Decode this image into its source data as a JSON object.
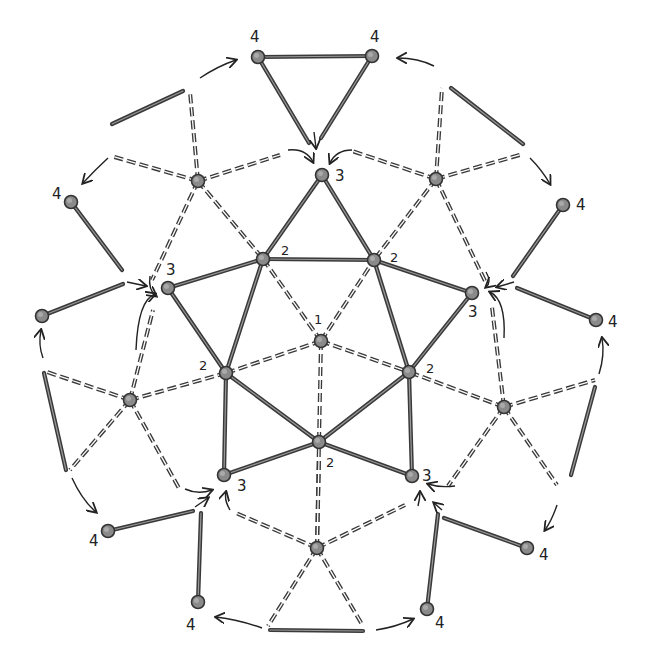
{
  "diagram": {
    "colors": {
      "edge": "#3a3a3a",
      "node_fill": "#8a8a8a",
      "background": "#ffffff"
    },
    "nodes": [
      {
        "id": "c",
        "x": 321,
        "y": 341,
        "label": "1",
        "lx": 314,
        "ly": 324
      },
      {
        "id": "a2",
        "x": 263,
        "y": 259,
        "label": "2",
        "lx": 281,
        "ly": 255
      },
      {
        "id": "b2",
        "x": 374,
        "y": 260,
        "label": "2",
        "lx": 390,
        "ly": 262
      },
      {
        "id": "d2",
        "x": 226,
        "y": 373,
        "label": "2",
        "lx": 199,
        "ly": 370
      },
      {
        "id": "e2",
        "x": 409,
        "y": 372,
        "label": "2",
        "lx": 426,
        "ly": 373
      },
      {
        "id": "f2",
        "x": 319,
        "y": 442,
        "label": "2",
        "lx": 326,
        "ly": 467
      },
      {
        "id": "a3",
        "x": 322,
        "y": 175,
        "label": "3",
        "lx": 335,
        "ly": 181
      },
      {
        "id": "b3",
        "x": 168,
        "y": 288,
        "label": "3",
        "lx": 166,
        "ly": 275
      },
      {
        "id": "c3",
        "x": 472,
        "y": 293,
        "label": "3",
        "lx": 468,
        "ly": 317
      },
      {
        "id": "d3",
        "x": 224,
        "y": 475,
        "label": "3",
        "lx": 237,
        "ly": 491
      },
      {
        "id": "e3",
        "x": 412,
        "y": 476,
        "label": "3",
        "lx": 422,
        "ly": 481
      },
      {
        "id": "h1",
        "x": 198,
        "y": 181,
        "label": "",
        "lx": 0,
        "ly": 0
      },
      {
        "id": "h2",
        "x": 436,
        "y": 179,
        "label": "",
        "lx": 0,
        "ly": 0
      },
      {
        "id": "h3",
        "x": 130,
        "y": 400,
        "label": "",
        "lx": 0,
        "ly": 0
      },
      {
        "id": "h4",
        "x": 504,
        "y": 407,
        "label": "",
        "lx": 0,
        "ly": 0
      },
      {
        "id": "h5",
        "x": 317,
        "y": 548,
        "label": "",
        "lx": 0,
        "ly": 0
      },
      {
        "id": "t1",
        "x": 258,
        "y": 57,
        "label": "4",
        "lx": 250,
        "ly": 42
      },
      {
        "id": "t2",
        "x": 372,
        "y": 56,
        "label": "4",
        "lx": 370,
        "ly": 42
      },
      {
        "id": "l1",
        "x": 71,
        "y": 202,
        "label": "4",
        "lx": 52,
        "ly": 199
      },
      {
        "id": "l2",
        "x": 42,
        "y": 316,
        "label": "",
        "lx": 0,
        "ly": 0
      },
      {
        "id": "r1",
        "x": 563,
        "y": 205,
        "label": "4",
        "lx": 576,
        "ly": 210
      },
      {
        "id": "r2",
        "x": 596,
        "y": 320,
        "label": "4",
        "lx": 608,
        "ly": 327
      },
      {
        "id": "bl1",
        "x": 108,
        "y": 531,
        "label": "4",
        "lx": 89,
        "ly": 546
      },
      {
        "id": "bl2",
        "x": 198,
        "y": 602,
        "label": "4",
        "lx": 186,
        "ly": 630
      },
      {
        "id": "br1",
        "x": 527,
        "y": 548,
        "label": "4",
        "lx": 539,
        "ly": 560
      },
      {
        "id": "br2",
        "x": 427,
        "y": 609,
        "label": "4",
        "lx": 435,
        "ly": 628
      }
    ],
    "solid_edges": [
      [
        "a2",
        "b2"
      ],
      [
        "a2",
        "a3"
      ],
      [
        "b2",
        "a3"
      ],
      [
        "a2",
        "b3"
      ],
      [
        "a2",
        "d2"
      ],
      [
        "b3",
        "d2"
      ],
      [
        "b2",
        "c3"
      ],
      [
        "b2",
        "e2"
      ],
      [
        "c3",
        "e2"
      ],
      [
        "d2",
        "f2"
      ],
      [
        "d2",
        "d3"
      ],
      [
        "d3",
        "f2"
      ],
      [
        "e2",
        "f2"
      ],
      [
        "e2",
        "e3"
      ],
      [
        "e3",
        "f2"
      ],
      [
        "t1",
        "t2"
      ]
    ],
    "solid_segments": [
      [
        258,
        57,
        309,
        143
      ],
      [
        372,
        56,
        321,
        138
      ],
      [
        71,
        202,
        122,
        270
      ],
      [
        42,
        316,
        123,
        284
      ],
      [
        563,
        205,
        513,
        276
      ],
      [
        596,
        320,
        517,
        288
      ],
      [
        108,
        531,
        193,
        511
      ],
      [
        198,
        602,
        201,
        513
      ],
      [
        527,
        548,
        444,
        518
      ],
      [
        427,
        609,
        438,
        514
      ],
      [
        112,
        124,
        183,
        91
      ],
      [
        451,
        88,
        523,
        144
      ],
      [
        44,
        373,
        66,
        470
      ],
      [
        595,
        387,
        571,
        475
      ],
      [
        270,
        630,
        363,
        631
      ]
    ],
    "dashed_edges": [
      [
        "c",
        "a2"
      ],
      [
        "c",
        "b2"
      ],
      [
        "c",
        "d2"
      ],
      [
        "c",
        "e2"
      ],
      [
        "c",
        "f2"
      ],
      [
        "h1",
        "a2"
      ],
      [
        "h2",
        "b2"
      ],
      [
        "h3",
        "d2"
      ],
      [
        "h4",
        "e2"
      ],
      [
        "h5",
        "f2"
      ]
    ],
    "dashed_segments": [
      [
        198,
        181,
        190,
        92
      ],
      [
        198,
        181,
        111,
        156
      ],
      [
        198,
        181,
        152,
        280
      ],
      [
        198,
        181,
        280,
        155
      ],
      [
        436,
        179,
        442,
        88
      ],
      [
        436,
        179,
        523,
        154
      ],
      [
        436,
        179,
        486,
        283
      ],
      [
        436,
        179,
        352,
        151
      ],
      [
        130,
        400,
        44,
        371
      ],
      [
        130,
        400,
        70,
        470
      ],
      [
        130,
        400,
        180,
        490
      ],
      [
        130,
        400,
        153,
        310
      ],
      [
        504,
        407,
        595,
        380
      ],
      [
        504,
        407,
        557,
        485
      ],
      [
        504,
        407,
        448,
        486
      ],
      [
        504,
        407,
        492,
        307
      ],
      [
        317,
        548,
        236,
        513
      ],
      [
        317,
        548,
        405,
        505
      ],
      [
        317,
        548,
        268,
        626
      ],
      [
        317,
        548,
        363,
        626
      ],
      [
        317,
        548,
        319,
        460
      ]
    ],
    "arrows": [
      {
        "d": "M 200 78 Q 218 66 236 60",
        "head": [
          236,
          60
        ]
      },
      {
        "d": "M 108 158 Q 95 170 83 183",
        "head": [
          83,
          183
        ]
      },
      {
        "d": "M 434 66 Q 418 58 398 58",
        "head": [
          398,
          58
        ]
      },
      {
        "d": "M 530 158 Q 542 170 550 184",
        "head": [
          550,
          184
        ]
      },
      {
        "d": "M 314 132 L 316 148",
        "head": [
          316,
          148
        ]
      },
      {
        "d": "M 288 150 Q 306 148 313 162",
        "head": [
          313,
          162
        ]
      },
      {
        "d": "M 352 150 Q 336 150 330 163",
        "head": [
          330,
          163
        ]
      },
      {
        "d": "M 127 282 L 146 286",
        "head": [
          146,
          286
        ]
      },
      {
        "d": "M 150 276 Q 148 290 156 296",
        "head": [
          156,
          296
        ]
      },
      {
        "d": "M 136 350 Q 138 300 155 294",
        "head": [
          155,
          294
        ]
      },
      {
        "d": "M 514 282 L 497 287",
        "head": [
          497,
          287
        ]
      },
      {
        "d": "M 486 272 Q 492 282 486 287",
        "head": [
          486,
          287
        ]
      },
      {
        "d": "M 504 338 Q 506 300 490 292",
        "head": [
          490,
          292
        ]
      },
      {
        "d": "M 43 358 Q 38 345 41 330",
        "head": [
          41,
          330
        ]
      },
      {
        "d": "M 599 374 Q 605 355 602 338",
        "head": [
          602,
          338
        ]
      },
      {
        "d": "M 185 489 Q 198 495 212 490",
        "head": [
          212,
          490
        ]
      },
      {
        "d": "M 195 507 L 208 498",
        "head": [
          208,
          498
        ]
      },
      {
        "d": "M 230 510 Q 224 500 226 492",
        "head": [
          226,
          492
        ]
      },
      {
        "d": "M 455 486 Q 440 488 428 484",
        "head": [
          428,
          484
        ]
      },
      {
        "d": "M 418 506 Q 420 498 420 492",
        "head": [
          420,
          492
        ]
      },
      {
        "d": "M 442 510 L 434 503",
        "head": [
          434,
          503
        ]
      },
      {
        "d": "M 557 505 Q 552 520 545 530",
        "head": [
          545,
          530
        ]
      },
      {
        "d": "M 72 478 Q 82 500 96 512",
        "head": [
          96,
          512
        ]
      },
      {
        "d": "M 262 628 Q 240 620 216 617",
        "head": [
          216,
          617
        ]
      },
      {
        "d": "M 376 630 Q 396 627 413 619",
        "head": [
          413,
          619
        ]
      }
    ]
  }
}
